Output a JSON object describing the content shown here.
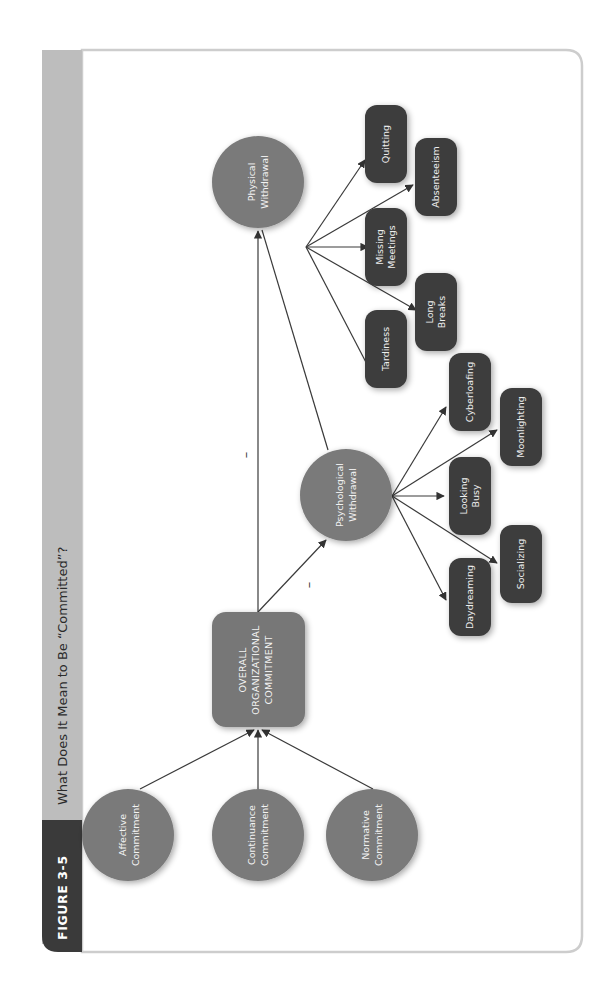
{
  "header": {
    "figure_label": "FIGURE 3-5",
    "title": "What Does It Mean to Be “Committed”?"
  },
  "colors": {
    "circle_fill": "#7a7a7a",
    "box_fill": "#3d3d3d",
    "center_fill": "#777777",
    "header_strip": "#bdbdbd",
    "figure_tab": "#3a3a3a",
    "card_border": "#cfcfcf"
  },
  "diagram": {
    "commitment_types": [
      {
        "line1": "Affective",
        "line2": "Commitment"
      },
      {
        "line1": "Continuance",
        "line2": "Commitment"
      },
      {
        "line1": "Normative",
        "line2": "Commitment"
      }
    ],
    "center": {
      "line1": "OVERALL",
      "line2": "ORGANIZATIONAL",
      "line3": "COMMITMENT"
    },
    "psychological": {
      "line1": "Psychological",
      "line2": "Withdrawal"
    },
    "physical": {
      "line1": "Physical",
      "line2": "Withdrawal"
    },
    "psychological_behaviors": [
      {
        "line1": "Daydreaming",
        "line2": ""
      },
      {
        "line1": "Socializing",
        "line2": ""
      },
      {
        "line1": "Looking",
        "line2": "Busy"
      },
      {
        "line1": "Moonlighting",
        "line2": ""
      },
      {
        "line1": "Cyberloafing",
        "line2": ""
      }
    ],
    "physical_behaviors": [
      {
        "line1": "Tardiness",
        "line2": ""
      },
      {
        "line1": "Long",
        "line2": "Breaks"
      },
      {
        "line1": "Missing",
        "line2": "Meetings"
      },
      {
        "line1": "Absenteeism",
        "line2": ""
      },
      {
        "line1": "Quitting",
        "line2": ""
      }
    ],
    "relationship_signs": {
      "to_psychological": "–",
      "to_physical": "–"
    }
  }
}
